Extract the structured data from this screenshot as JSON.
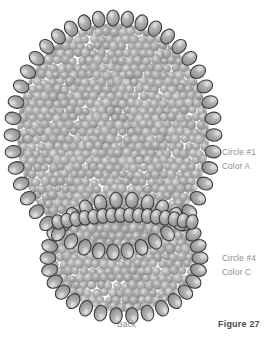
{
  "figure": {
    "caption": "Figure 27"
  },
  "labels": {
    "circle_1": "Circle #1",
    "color_a": "Color A",
    "circle_4": "Circle #4",
    "color_c": "Color C",
    "back": "Back"
  },
  "colors": {
    "background": "#ffffff",
    "bead_fill": "#a8a8a8",
    "bead_fill_light": "#c9c9c9",
    "bead_fill_dark": "#8b8b8b",
    "bead_outline": "#3a3a3a",
    "bead_highlight": "#dedede",
    "label_text": "#8c8c8c",
    "caption_text": "#4a4a4a"
  },
  "geometry": {
    "upper_circle": {
      "cx": 113,
      "cy": 135,
      "rx": 101,
      "ry": 117
    },
    "lower_circle": {
      "cx": 124,
      "cy": 258,
      "rx": 76,
      "ry": 58
    },
    "outer_bead_rx": 6.2,
    "outer_bead_ry": 8.0,
    "inner_bead_r": 4.6,
    "upper_outer_bead_count": 44,
    "lower_outer_bead_count": 30,
    "junction_bead_count": 16
  }
}
